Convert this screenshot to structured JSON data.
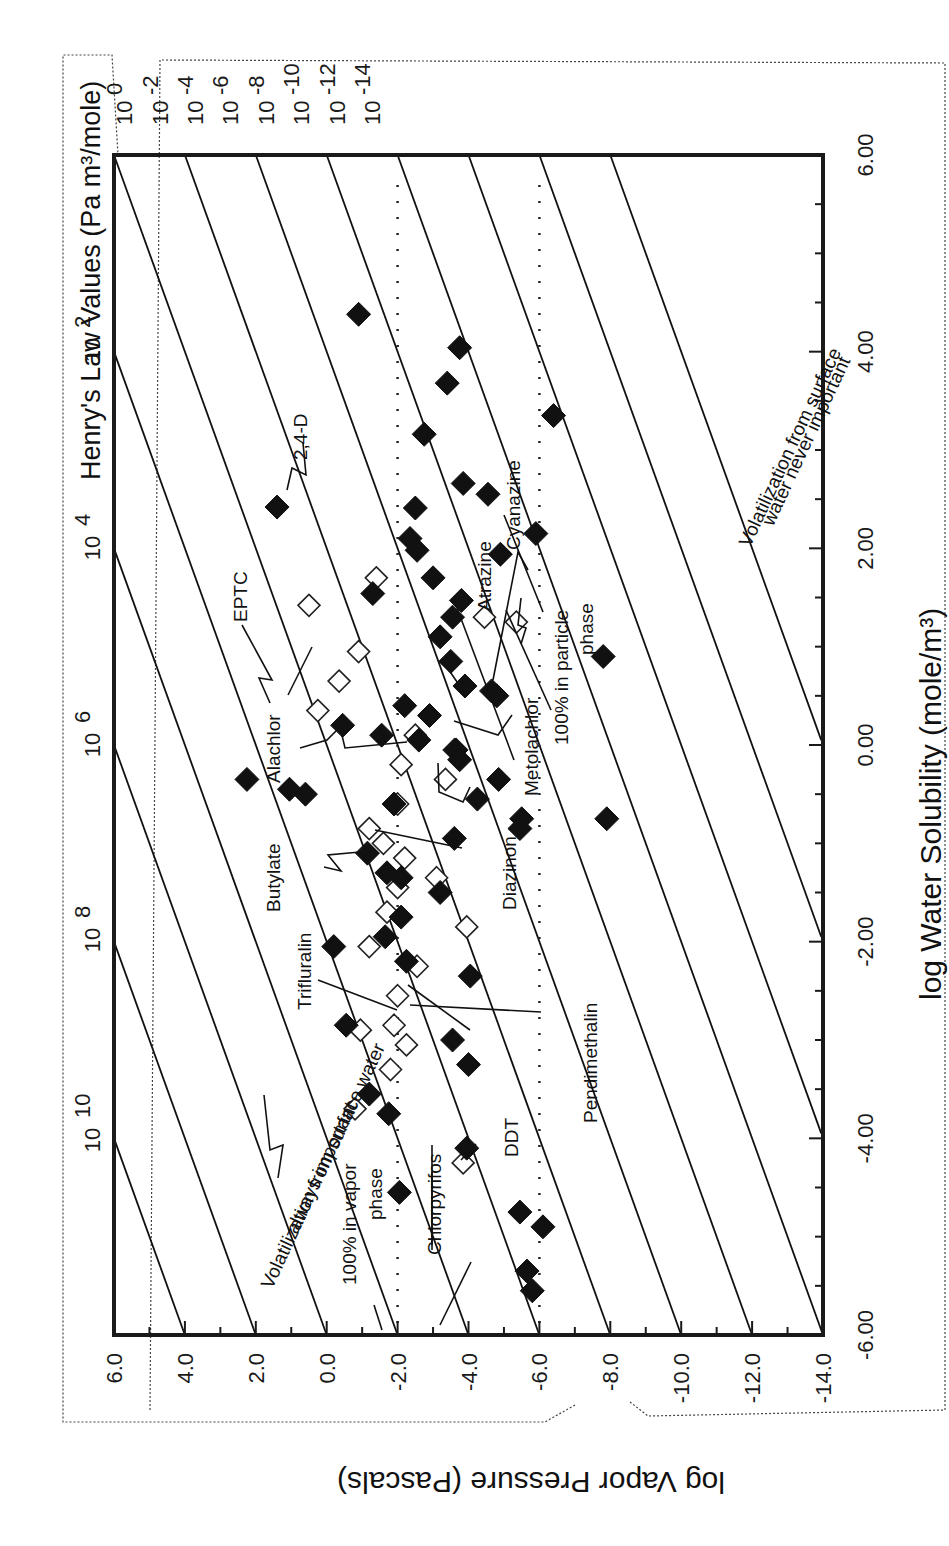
{
  "chart_data": {
    "type": "scatter",
    "orientation_note": "figure is printed rotated 90 degrees clockwise",
    "title": "",
    "xlabel": "log Water Solubility (mole/m³)",
    "ylabel": "log Vapor Pressure (Pascals)",
    "secondary_label": "Henry's Law Values (Pa m³/mole)",
    "xlim": [
      -6.0,
      6.0
    ],
    "ylim": [
      -14.0,
      6.0
    ],
    "x_ticks": [
      "-6.00",
      "-4.00",
      "-2.00",
      "0.00",
      "2.00",
      "4.00",
      "6.00"
    ],
    "y_ticks": [
      "6.0",
      "4.0",
      "2.0",
      "0.0",
      "-2.0",
      "-4.0",
      "-6.0",
      "-8.0",
      "-10.0",
      "-12.0",
      "-14.0"
    ],
    "henry_labels_left": [
      "10 10",
      "10 8",
      "10 6",
      "10 4",
      "10 2"
    ],
    "henry_labels_top": [
      "10 0",
      "10 -2",
      "10 -4",
      "10 -6",
      "10 -8",
      "10 -10",
      "10 -12",
      "10 -14"
    ],
    "henry_isolines": [
      10,
      8,
      6,
      4,
      2,
      0,
      -2,
      -4,
      -6,
      -8,
      -10,
      -12,
      -14
    ],
    "reference_lines": [
      {
        "type": "dotted",
        "log_vapor_pressure": -2.0
      },
      {
        "type": "dotted",
        "log_vapor_pressure": -6.0
      }
    ],
    "grid": false,
    "series": [
      {
        "name": "pesticides (filled)",
        "marker": "filled-diamond",
        "points": [
          [
            4.38,
            -0.9
          ],
          [
            4.04,
            -3.75
          ],
          [
            3.68,
            -3.4
          ],
          [
            3.16,
            -2.75
          ],
          [
            2.66,
            -3.85
          ],
          [
            2.55,
            -4.55
          ],
          [
            2.42,
            1.4
          ],
          [
            2.41,
            -2.5
          ],
          [
            2.1,
            -2.35
          ],
          [
            1.98,
            -2.55
          ],
          [
            1.94,
            -4.9
          ],
          [
            1.7,
            -3.0
          ],
          [
            1.54,
            -1.3
          ],
          [
            1.47,
            -3.8
          ],
          [
            1.1,
            -3.2
          ],
          [
            0.85,
            -3.5
          ],
          [
            0.6,
            -3.9
          ],
          [
            0.55,
            -4.65
          ],
          [
            0.5,
            -4.8
          ],
          [
            0.4,
            -2.2
          ],
          [
            0.3,
            -2.9
          ],
          [
            0.2,
            -0.45
          ],
          [
            0.1,
            -1.55
          ],
          [
            0.05,
            -2.6
          ],
          [
            -0.05,
            -3.65
          ],
          [
            -0.15,
            -3.75
          ],
          [
            -0.35,
            2.25
          ],
          [
            -0.45,
            1.05
          ],
          [
            -0.5,
            0.6
          ],
          [
            -0.55,
            -4.25
          ],
          [
            -0.6,
            -1.9
          ],
          [
            -0.75,
            -5.5
          ],
          [
            -0.85,
            -5.45
          ],
          [
            -0.95,
            -3.6
          ],
          [
            -1.1,
            -1.15
          ],
          [
            -1.3,
            -1.7
          ],
          [
            -1.35,
            -2.1
          ],
          [
            -1.5,
            -3.2
          ],
          [
            -1.75,
            -2.1
          ],
          [
            -1.95,
            -1.65
          ],
          [
            -2.05,
            -0.2
          ],
          [
            -2.2,
            -2.25
          ],
          [
            -2.35,
            -4.05
          ],
          [
            -2.85,
            -0.55
          ],
          [
            -3.0,
            -3.55
          ],
          [
            -3.25,
            -4.0
          ],
          [
            -3.55,
            -1.2
          ],
          [
            -3.75,
            -1.75
          ],
          [
            -4.1,
            -3.95
          ],
          [
            -4.55,
            -2.05
          ],
          [
            -4.75,
            -5.45
          ],
          [
            -4.9,
            -6.1
          ],
          [
            -5.35,
            -5.65
          ],
          [
            -5.55,
            -5.8
          ],
          [
            3.35,
            -6.4
          ],
          [
            2.15,
            -5.9
          ],
          [
            -0.75,
            -7.9
          ],
          [
            0.9,
            -7.8
          ],
          [
            -0.35,
            -4.85
          ],
          [
            1.3,
            -3.55
          ]
        ]
      },
      {
        "name": "pesticides (open)",
        "marker": "open-diamond",
        "points": [
          [
            1.42,
            0.5
          ],
          [
            1.7,
            -1.4
          ],
          [
            1.3,
            -4.45
          ],
          [
            0.95,
            -0.9
          ],
          [
            0.65,
            -0.35
          ],
          [
            0.35,
            0.25
          ],
          [
            0.1,
            -2.5
          ],
          [
            -0.05,
            -3.6
          ],
          [
            -0.35,
            -3.35
          ],
          [
            -0.6,
            -2.0
          ],
          [
            -0.85,
            -1.2
          ],
          [
            -1.0,
            -1.6
          ],
          [
            -1.15,
            -2.2
          ],
          [
            -1.35,
            -3.1
          ],
          [
            -1.45,
            -2.0
          ],
          [
            -1.7,
            -1.7
          ],
          [
            -1.85,
            -3.95
          ],
          [
            -2.05,
            -1.2
          ],
          [
            -2.25,
            -2.55
          ],
          [
            -2.55,
            -2.0
          ],
          [
            -2.85,
            -1.9
          ],
          [
            -3.05,
            -2.25
          ],
          [
            -3.3,
            -1.8
          ],
          [
            -3.7,
            -0.8
          ],
          [
            -4.25,
            -3.85
          ],
          [
            -2.9,
            -0.95
          ],
          [
            1.25,
            -5.35
          ],
          [
            -0.2,
            -2.1
          ]
        ]
      }
    ],
    "annotations": [
      "EPTC",
      "2,4-D",
      "Alachlor",
      "Butylate",
      "Trifluralin",
      "Chlorpyrifos",
      "DDT",
      "Pendimethalin",
      "Diazinon",
      "Metolachlor",
      "Atrazine",
      "Cyanazine",
      "100% in vapor phase",
      "100% in particle phase",
      "Volatilization from surface water always important",
      "Volatilization from surface water never important"
    ]
  },
  "text": {
    "henry_title": "Henry's Law Values (Pa m³/mole)",
    "xlabel": "log Water Solubility (mole/m³)",
    "ylabel": "log Vapor Pressure (Pascals)",
    "ann_eptc": "EPTC",
    "ann_24d": "2,4-D",
    "ann_alachlor": "Alachlor",
    "ann_butylate": "Butylate",
    "ann_trifluralin": "Trifluralin",
    "ann_chlorpyrifos": "Chlorpyrifos",
    "ann_ddt": "DDT",
    "ann_pendimethalin": "Pendimethalin",
    "ann_diazinon": "Diazinon",
    "ann_metolachlor": "Metolachlor",
    "ann_atrazine": "Atrazine",
    "ann_cyanazine": "Cyanazine",
    "vapor_1": "100% in vapor",
    "vapor_2": "phase",
    "particle_1": "100% in particle",
    "particle_2": "phase",
    "always_1": "Volatilization from surface water",
    "always_2": "always important",
    "never_1": "Volatilization from surface",
    "never_2": "water never important"
  }
}
